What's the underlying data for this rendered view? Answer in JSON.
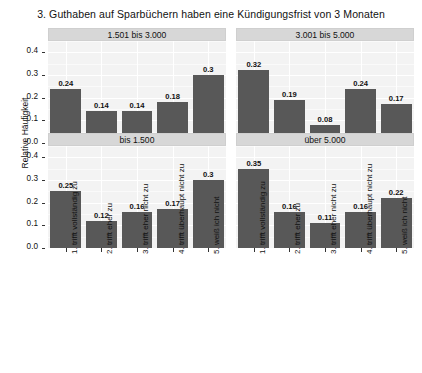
{
  "chart_data": {
    "type": "bar",
    "title": "3. Guthaben auf Sparbüchern haben eine Kündigungsfrist von 3 Monaten",
    "xlabel": "",
    "ylabel": "Relative Häufigkeit",
    "ylim": [
      0,
      0.45
    ],
    "yticks": [
      "0.0",
      "0.1",
      "0.2",
      "0.3",
      "0.4"
    ],
    "ytick_values": [
      0.0,
      0.1,
      0.2,
      0.3,
      0.4
    ],
    "grid": true,
    "legend": "none",
    "facet_layout": "2x2",
    "categories": [
      "1. trifft vollständig zu",
      "2. trifft eher zu",
      "3. trifft eher nicht zu",
      "4. trifft überhaupt nicht zu",
      "5. weiß ich nicht"
    ],
    "panels": [
      {
        "name": "1.501 bis 3.000",
        "row": 0,
        "col": 0,
        "values": [
          0.24,
          0.14,
          0.14,
          0.18,
          0.3
        ],
        "labels": [
          "0.24",
          "0.14",
          "0.14",
          "0.18",
          "0.3"
        ]
      },
      {
        "name": "3.001 bis 5.000",
        "row": 0,
        "col": 1,
        "values": [
          0.32,
          0.19,
          0.08,
          0.24,
          0.17
        ],
        "labels": [
          "0.32",
          "0.19",
          "0.08",
          "0.24",
          "0.17"
        ]
      },
      {
        "name": "bis 1.500",
        "row": 1,
        "col": 0,
        "values": [
          0.25,
          0.12,
          0.16,
          0.17,
          0.3
        ],
        "labels": [
          "0.25",
          "0.12",
          "0.16",
          "0.17",
          "0.3"
        ]
      },
      {
        "name": "über 5.000",
        "row": 1,
        "col": 1,
        "values": [
          0.35,
          0.16,
          0.11,
          0.16,
          0.22
        ],
        "labels": [
          "0.35",
          "0.16",
          "0.11",
          "0.16",
          "0.22"
        ]
      }
    ],
    "colors": {
      "bar": "#585858",
      "panel_background": "#f3f3f3",
      "strip_background": "#d7d7d7",
      "grid": "#ffffff",
      "text": "#111111"
    }
  }
}
